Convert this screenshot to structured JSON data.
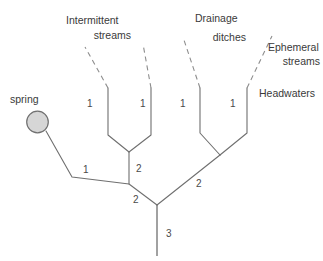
{
  "diagram": {
    "colors": {
      "stroke": "#6f6f6f",
      "dashed_stroke": "#8d8d8d",
      "spring_fill": "#d6d6d6",
      "spring_stroke": "#707070",
      "text": "#3a3a3a",
      "background": "#ffffff"
    },
    "labels": {
      "spring": "spring",
      "intermittent_line1": "Intermittent",
      "intermittent_line2": "streams",
      "drainage_line1": "Drainage",
      "drainage_line2": "ditches",
      "ephemeral_line1": "Ephemeral",
      "ephemeral_line2": "streams",
      "headwaters": "Headwaters"
    },
    "stream_orders": {
      "spring_branch": "1",
      "intermittent_left": "1",
      "intermittent_right": "1",
      "drainage_left": "1",
      "ephemeral_right": "1",
      "intermittent_confluence": "2",
      "lower_left_confluence": "2",
      "right_confluence": "2",
      "trunk": "3"
    }
  }
}
